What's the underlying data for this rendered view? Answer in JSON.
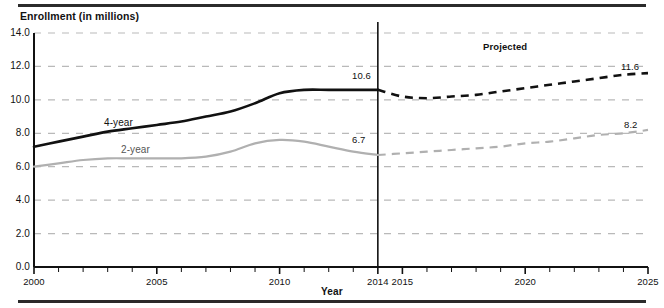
{
  "chart_data": {
    "type": "line",
    "title": "Enrollment (in millions)",
    "xlabel": "Year",
    "ylabel": "Enrollment (in millions)",
    "ylim": [
      0.0,
      14.0
    ],
    "xlim": [
      2000,
      2025
    ],
    "ytick_labels": [
      "0.0",
      "2.0",
      "4.0",
      "6.0",
      "8.0",
      "10.0",
      "12.0",
      "14.0"
    ],
    "ytick_values": [
      0.0,
      2.0,
      4.0,
      6.0,
      8.0,
      10.0,
      12.0,
      14.0
    ],
    "xtick_labels": [
      "2000",
      "2005",
      "2010",
      "2014",
      "2015",
      "2020",
      "2025"
    ],
    "xtick_values": [
      2000,
      2005,
      2010,
      2014,
      2015,
      2020,
      2025
    ],
    "grid": true,
    "grid_style": "dashed",
    "grid_color": "#b9b9b9",
    "legend": "inline-labels",
    "x": [
      2000,
      2001,
      2002,
      2003,
      2004,
      2005,
      2006,
      2007,
      2008,
      2009,
      2010,
      2011,
      2012,
      2013,
      2014,
      2015,
      2016,
      2017,
      2018,
      2019,
      2020,
      2021,
      2022,
      2023,
      2024,
      2025
    ],
    "actual_projected_split_year": 2014,
    "series": [
      {
        "name": "4-year",
        "label": "4-year",
        "color": "#111111",
        "values": [
          7.2,
          7.5,
          7.8,
          8.1,
          8.3,
          8.5,
          8.7,
          9.0,
          9.3,
          9.8,
          10.4,
          10.6,
          10.6,
          10.6,
          10.6,
          10.2,
          10.1,
          10.2,
          10.3,
          10.5,
          10.7,
          10.9,
          11.1,
          11.3,
          11.5,
          11.6
        ],
        "end_label": "11.6",
        "split_label": "10.6"
      },
      {
        "name": "2-year",
        "label": "2-year",
        "color": "#b0b0b0",
        "values": [
          6.0,
          6.2,
          6.4,
          6.5,
          6.5,
          6.5,
          6.5,
          6.6,
          6.9,
          7.4,
          7.6,
          7.5,
          7.2,
          6.9,
          6.7,
          6.8,
          6.9,
          7.0,
          7.1,
          7.2,
          7.4,
          7.5,
          7.7,
          7.9,
          8.0,
          8.2
        ],
        "end_label": "8.2",
        "split_label": "6.7"
      }
    ],
    "annotations": [
      {
        "text": "Projected",
        "x": 2019.5,
        "y": 12.7
      }
    ]
  },
  "labels": {
    "title": "Enrollment (in millions)",
    "xaxis": "Year",
    "projected": "Projected",
    "four_year": "4-year",
    "two_year": "2-year",
    "four_year_split_value": "10.6",
    "two_year_split_value": "6.7",
    "four_year_end_value": "11.6",
    "two_year_end_value": "8.2",
    "y0": "0.0",
    "y1": "2.0",
    "y2": "4.0",
    "y3": "6.0",
    "y4": "8.0",
    "y5": "10.0",
    "y6": "12.0",
    "y7": "14.0",
    "x2000": "2000",
    "x2005": "2005",
    "x2010": "2010",
    "x2014": "2014",
    "x2015": "2015",
    "x2020": "2020",
    "x2025": "2025"
  }
}
